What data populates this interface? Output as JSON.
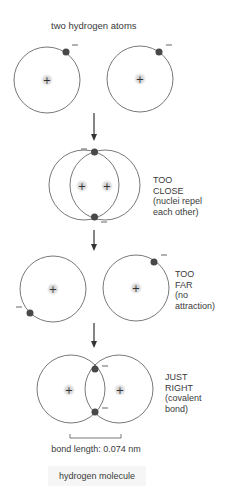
{
  "title": "two hydrogen atoms",
  "colors": {
    "line": "#555555",
    "electron": "#484848",
    "nucleus_glow": "#cfcfcf",
    "caption_bg": "#f6f6f6"
  },
  "stages": [
    {
      "id": "separate",
      "label_lines": []
    },
    {
      "id": "too-close",
      "label_lines": [
        "TOO",
        "CLOSE",
        "(nuclei repel",
        "each other)"
      ]
    },
    {
      "id": "too-far",
      "label_lines": [
        "TOO",
        "FAR",
        "(no",
        "attraction)"
      ]
    },
    {
      "id": "just-right",
      "label_lines": [
        "JUST",
        "RIGHT",
        "(covalent",
        "bond)"
      ]
    }
  ],
  "symbols": {
    "nucleus": "+",
    "electron_charge": "−"
  },
  "bond_length_label": "bond length: 0.074 nm",
  "caption": "hydrogen molecule"
}
